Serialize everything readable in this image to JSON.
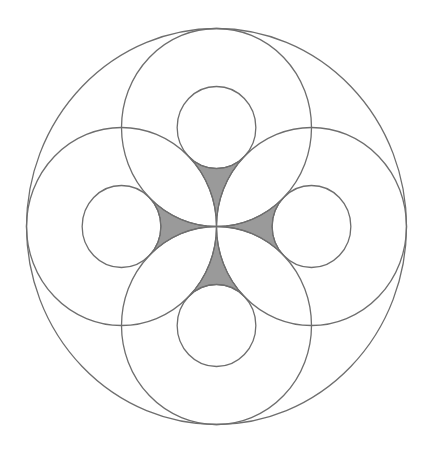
{
  "figure": {
    "title": "Circle packing diagram with four shaded curvilinear regions",
    "colors": {
      "background": "#ffffff",
      "stroke": "#6e6e6e",
      "shade_fill": "#9a9a9a",
      "shade_stroke": "#555555"
    },
    "center_px": [
      216.5,
      226.5
    ],
    "unit_px": [
      95,
      99
    ],
    "outer_circle": {
      "cx": 0,
      "cy": 0,
      "r": 2
    },
    "large_circles": [
      {
        "name": "top",
        "cx": 0,
        "cy": -1,
        "r": 1
      },
      {
        "name": "right",
        "cx": 1,
        "cy": 0,
        "r": 1
      },
      {
        "name": "bottom",
        "cx": 0,
        "cy": 1,
        "r": 1
      },
      {
        "name": "left",
        "cx": -1,
        "cy": 0,
        "r": 1
      }
    ],
    "small_circles": [
      {
        "name": "top",
        "cx": 0,
        "cy": -1,
        "r": 0.4142
      },
      {
        "name": "right",
        "cx": 1,
        "cy": 0,
        "r": 0.4142
      },
      {
        "name": "bottom",
        "cx": 0,
        "cy": 1,
        "r": 0.4142
      },
      {
        "name": "left",
        "cx": -1,
        "cy": 0,
        "r": 0.4142
      }
    ],
    "shaded_regions": [
      {
        "name": "top",
        "rotation": 0
      },
      {
        "name": "right",
        "rotation": 90
      },
      {
        "name": "bottom",
        "rotation": 180
      },
      {
        "name": "left",
        "rotation": 270
      }
    ]
  }
}
